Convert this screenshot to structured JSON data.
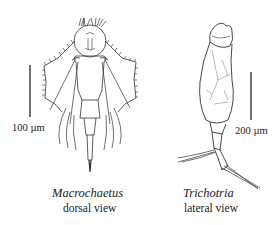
{
  "figure": {
    "specimens": [
      {
        "name": "Macrochaetus",
        "view": "dorsal view",
        "scale_bar": "100 µm"
      },
      {
        "name": "Trichotria",
        "view": "lateral view",
        "scale_bar": "200 µm"
      }
    ],
    "colors": {
      "ink": "#222222",
      "background": "#ffffff"
    }
  }
}
